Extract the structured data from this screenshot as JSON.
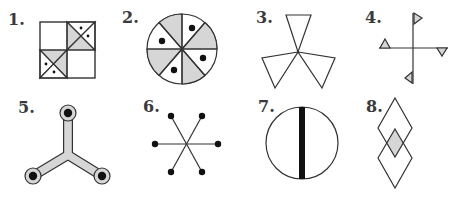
{
  "colors": {
    "stroke": "#333333",
    "fill_grey": "#d6d6d6",
    "fill_white": "#ffffff",
    "dot": "#111111"
  },
  "figures": [
    {
      "number": "1.",
      "label_text": "1.",
      "description": "Square divided into four quadrants; top-right and bottom-left quadrants contain an X with two grey triangles and two dotted white triangles"
    },
    {
      "number": "2.",
      "label_text": "2.",
      "description": "Circle divided into eight sectors alternating grey and white; white sectors contain dots"
    },
    {
      "number": "3.",
      "label_text": "3.",
      "description": "Three white triangles meeting at a central point (trefoil / propeller)"
    },
    {
      "number": "4.",
      "label_text": "4.",
      "description": "Cross with small grey triangular flags at each arm end"
    },
    {
      "number": "5.",
      "label_text": "5.",
      "description": "Grey three-armed Y-shaped connector with black dots in circular ends"
    },
    {
      "number": "6.",
      "label_text": "6.",
      "description": "Six-pointed asterisk of lines ending in black dots"
    },
    {
      "number": "7.",
      "label_text": "7.",
      "description": "Circle with a thick vertical black bar through its center"
    },
    {
      "number": "8.",
      "label_text": "8.",
      "description": "Two overlapping diamonds stacked vertically with grey intersection"
    }
  ]
}
